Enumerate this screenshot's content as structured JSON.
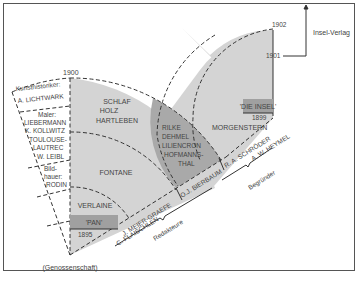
{
  "diagram": {
    "years": {
      "y1900": "1900",
      "y1895": "1895",
      "y1899": "1899",
      "y1901": "1901",
      "y1902": "1902"
    },
    "publisher": "Insel-Verlag",
    "magazines": {
      "pan": "'PAN'",
      "insel": "'DIE INSEL'"
    },
    "pan_authors": {
      "ring_outer": [
        "SCHLAF",
        "HOLZ",
        "HARTLEBEN"
      ],
      "ring_middle": "FONTANE",
      "ring_inner": "VERLAINE"
    },
    "overlap_authors": [
      "RILKE",
      "DEHMEL",
      "LILIENCRON",
      "HOFMANNS-",
      "THAL"
    ],
    "insel_authors": "MORGENSTERN",
    "cooperative": {
      "label": "(Genossenschaft)",
      "groups": [
        {
          "title": "Kunsthistoriker:",
          "names": [
            "A. LICHTWARK"
          ]
        },
        {
          "title": "Maler:",
          "names": [
            "LIEBERMANN",
            "K. KOLLWITZ",
            "TOULOUSE-",
            "LAUTREC",
            "W. LEIBL"
          ]
        },
        {
          "title": "Bild-",
          "title2": "hauer:",
          "names": [
            "RODIN"
          ]
        }
      ]
    },
    "editors": {
      "names": [
        "J. MEIER-GRAEFE",
        "C. FLAISCHLEN",
        "O.J. BIERBAUM"
      ],
      "label": "Redakteure"
    },
    "founders": {
      "names": [
        "R. A. SCHRÖDER",
        "A. W. HEYMEL"
      ],
      "label": "Begründer"
    },
    "colors": {
      "light_fill": "#d4d4d4",
      "dark_fill": "#a9a9a9",
      "box_fill": "#a0a0a0",
      "line": "#333333",
      "text": "#444444"
    }
  }
}
